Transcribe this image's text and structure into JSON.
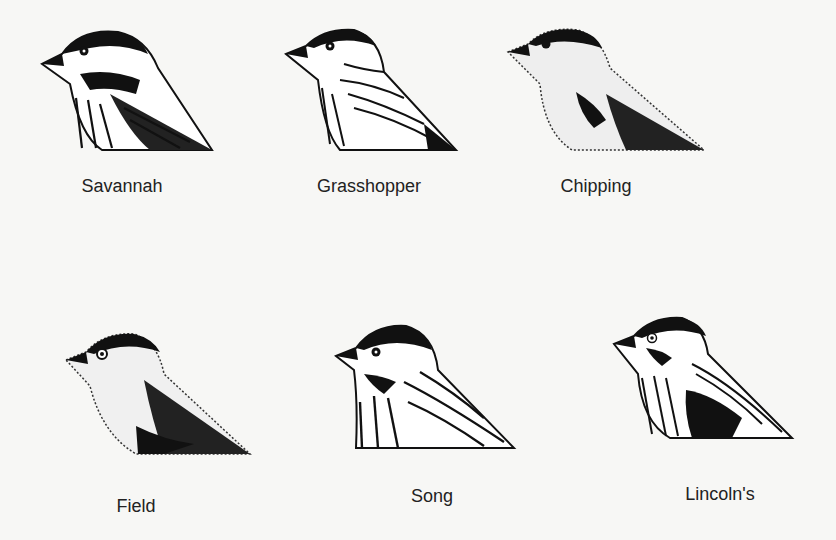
{
  "figure": {
    "birds": [
      {
        "name": "Savannah",
        "x": 40,
        "y": 24,
        "label_x": 122,
        "label_y": 176
      },
      {
        "name": "Grasshopper",
        "x": 284,
        "y": 24,
        "label_x": 369,
        "label_y": 176
      },
      {
        "name": "Chipping",
        "x": 506,
        "y": 24,
        "label_x": 596,
        "label_y": 176
      },
      {
        "name": "Field",
        "x": 64,
        "y": 330,
        "label_x": 136,
        "label_y": 496
      },
      {
        "name": "Song",
        "x": 334,
        "y": 322,
        "label_x": 432,
        "label_y": 486
      },
      {
        "name": "Lincoln's",
        "x": 612,
        "y": 314,
        "label_x": 720,
        "label_y": 484
      }
    ]
  },
  "colors": {
    "ink": "#111111",
    "paper": "#f7f7f5"
  }
}
